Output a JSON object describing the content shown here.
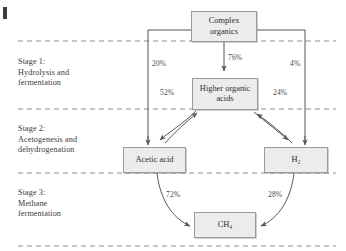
{
  "figure": {
    "background_color": "#ffffff",
    "box_fill": "#ececed",
    "box_border": "#9a9a9a",
    "line_color": "#555555",
    "text_color": "#2e2e2e"
  },
  "stages": [
    {
      "id": "stage-1",
      "label": "Stage 1:\nHydrolysis and\nfermentation"
    },
    {
      "id": "stage-2",
      "label": "Stage 2:\nAcetogenesis and\ndehydrogenation"
    },
    {
      "id": "stage-3",
      "label": "Stage 3:\nMethane\nfermentation"
    }
  ],
  "nodes": [
    {
      "id": "complex-organics",
      "label": "Complex\norganics"
    },
    {
      "id": "higher-organic-acids",
      "label": "Higher organic\nacids"
    },
    {
      "id": "acetic-acid",
      "label": "Acetic acid"
    },
    {
      "id": "hydrogen",
      "label": "H₂"
    },
    {
      "id": "methane",
      "label": "CH₄"
    }
  ],
  "flows": [
    {
      "id": "flow-complex-to-acetic",
      "from": "Complex organics",
      "to": "Acetic acid",
      "value": "20%"
    },
    {
      "id": "flow-complex-to-higher-acids",
      "from": "Complex organics",
      "to": "Higher organic acids",
      "value": "76%"
    },
    {
      "id": "flow-complex-to-hydrogen",
      "from": "Complex organics",
      "to": "H₂",
      "value": "4%"
    },
    {
      "id": "flow-higher-acids-to-acetic",
      "from": "Higher organic acids",
      "to": "Acetic acid",
      "value": "52%"
    },
    {
      "id": "flow-higher-acids-to-hydrogen",
      "from": "Higher organic acids",
      "to": "H₂",
      "value": "24%"
    },
    {
      "id": "flow-acetic-to-methane",
      "from": "Acetic acid",
      "to": "CH₄",
      "value": "72%"
    },
    {
      "id": "flow-hydrogen-to-methane",
      "from": "H₂",
      "to": "CH₄",
      "value": "28%"
    }
  ],
  "dividers": [
    {
      "id": "divider-1"
    },
    {
      "id": "divider-2"
    },
    {
      "id": "divider-3"
    },
    {
      "id": "divider-4"
    }
  ]
}
